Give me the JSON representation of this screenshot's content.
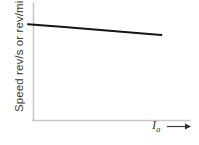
{
  "figure": {
    "name": "speed-vs-armature-current-characteristic",
    "background_color": "#ffffff",
    "axis_color": "#c9c9c9",
    "curve_color": "#151515",
    "label_color": "#3b3b3b"
  },
  "axes": {
    "y_label": "Speed rev/s or rev/min",
    "x_label_symbol": "I",
    "x_label_subscript": "a",
    "x_label_arrow": "→",
    "x_axis_has_arrow": true
  },
  "chart_data": {
    "type": "line",
    "title": "",
    "subtitle": "",
    "xlabel": "Ia",
    "ylabel": "Speed rev/s or rev/min",
    "grid": false,
    "legend": null,
    "legend_position": "none",
    "xlim": [
      0,
      1
    ],
    "ylim": [
      0,
      1
    ],
    "x_tick_labels": [],
    "y_tick_labels": [],
    "annotations": [],
    "series": [
      {
        "name": "Speed characteristic",
        "x": [
          0.0,
          0.25,
          0.5,
          0.75,
          0.92
        ],
        "y": [
          0.82,
          0.795,
          0.77,
          0.745,
          0.728
        ]
      }
    ]
  }
}
